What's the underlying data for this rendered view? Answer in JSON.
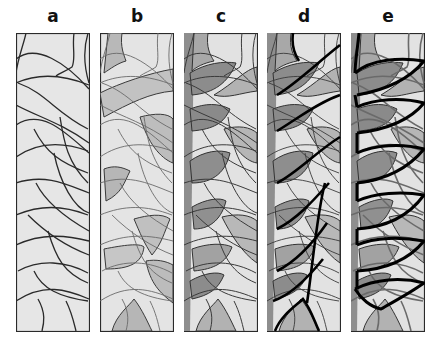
{
  "figure": {
    "panels": [
      {
        "id": "a",
        "label": "a",
        "x": 16,
        "mode": "outline"
      },
      {
        "id": "b",
        "label": "b",
        "x": 100,
        "mode": "light-fill"
      },
      {
        "id": "c",
        "label": "c",
        "x": 184,
        "mode": "full-fill"
      },
      {
        "id": "d",
        "label": "d",
        "x": 267,
        "mode": "fill-bold-lines"
      },
      {
        "id": "e",
        "label": "e",
        "x": 351,
        "mode": "fill-heavy-lines"
      }
    ],
    "panel_width": 73,
    "panel_height": 298,
    "colors": {
      "background": "#e6e6e6",
      "light_gray": "#d2d2d2",
      "mid_gray": "#b4b4b4",
      "dark_gray": "#969696",
      "line": "#2a2a2a",
      "thin_line": "#5a5a5a",
      "bold_line": "#000000"
    }
  }
}
